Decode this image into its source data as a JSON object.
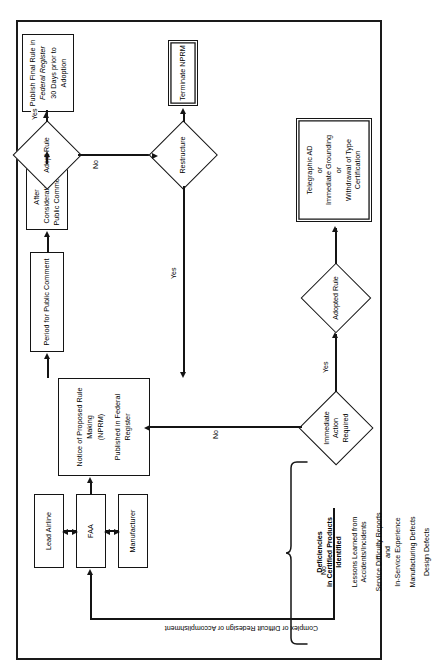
{
  "figure": {
    "orientation": "landscape-rotated-90",
    "line_color": "#141414",
    "background": "#ffffff"
  },
  "rail": {
    "caption": "Complex  or Difficult Redesign or Accomplishment"
  },
  "inputs": {
    "header_line1": "Deficiencies",
    "header_line2": "in Certified Products",
    "header_line3": "Identified",
    "items": [
      {
        "line1": "Lessons Learned from",
        "line2": "Accidents/Incidents"
      },
      {
        "line1": "Service Difficulty Reports",
        "line2": "and",
        "line3": "In-Service Experience"
      },
      {
        "line1": "Manufacturing Defects"
      },
      {
        "line1": "Design Defects"
      }
    ]
  },
  "nodes": {
    "manufacturer": {
      "label": "Manufacturer"
    },
    "faa": {
      "label": "FAA"
    },
    "lead_airline": {
      "label": "Lead Airline"
    },
    "nprm": {
      "line1": "Notice of Proposed Rule Making",
      "line2": "(NPRM)",
      "line3": "Published in Federal Register"
    },
    "period_comment": {
      "label": "Period for Public Comment"
    },
    "after_consideration": {
      "line1": "After Consideration of",
      "line2": "Public Comments"
    },
    "publish_final": {
      "line1": "Publish Final Rule in",
      "line2": "Federal Register",
      "line3": "30 Days prior to Adoption"
    },
    "terminate_nprm": {
      "label": "Terminate NPRM"
    },
    "telegraphic": {
      "line1": "Telegraphic AD",
      "line2": "or",
      "line3": "Immediate Grounding",
      "line4": "or",
      "line5": "Withdrawal of Type Certification"
    }
  },
  "decisions": {
    "immediate_action": {
      "line1": "Immediate",
      "line2": "Action",
      "line3": "Required"
    },
    "adopted_rule": {
      "label": "Adopted Rule"
    },
    "restructure": {
      "label": "Restructure"
    },
    "adopt_rule": {
      "label": "Adopt Rule"
    }
  },
  "edge_labels": {
    "immediate_no": "No",
    "immediate_yes": "Yes",
    "restructure_yes": "Yes",
    "adopt_yes": "Yes",
    "adopt_no": "No",
    "rail_no": "No"
  }
}
